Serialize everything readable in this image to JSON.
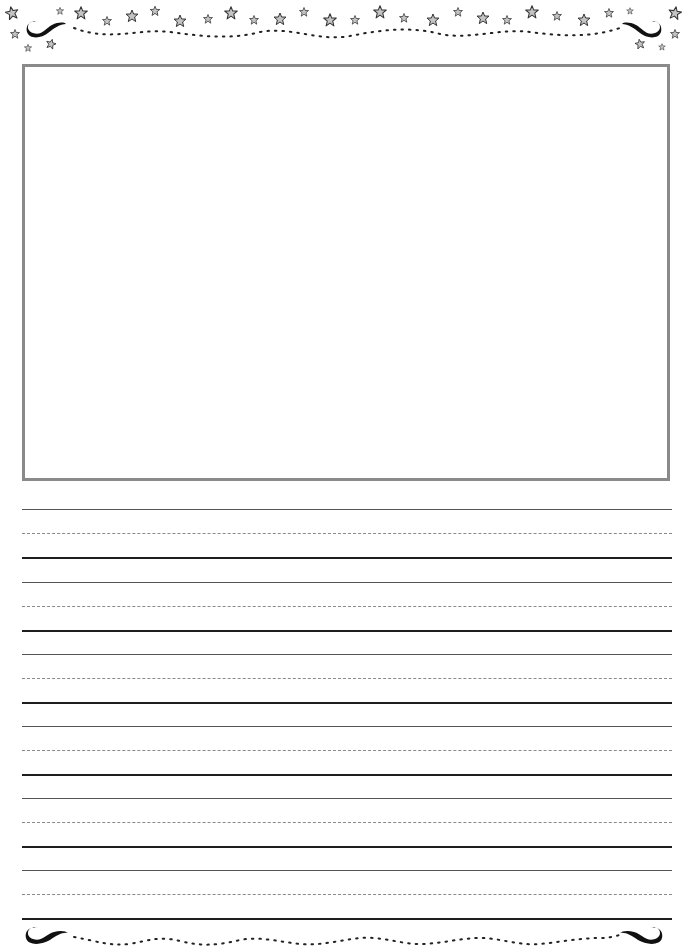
{
  "page": {
    "type": "primary-writing-paper",
    "background": "#ffffff"
  },
  "border": {
    "top": {
      "decoration": "stars-and-swirls",
      "icons": [
        "star-icon",
        "swirl-icon",
        "dotted-wave"
      ],
      "star_fill": "#c4c4c4",
      "star_stroke": "#333333",
      "swirl_color": "#111111"
    },
    "bottom": {
      "decoration": "swirls-and-dots",
      "icons": [
        "swirl-icon",
        "dotted-wave"
      ]
    }
  },
  "picture_box": {
    "border_color": "#8a8a8a",
    "content": ""
  },
  "writing_lines": {
    "set_count": 6,
    "sets": [
      {
        "top": 509,
        "mid": 533,
        "base": 557
      },
      {
        "top": 582,
        "mid": 606,
        "base": 630
      },
      {
        "top": 654,
        "mid": 678,
        "base": 702
      },
      {
        "top": 726,
        "mid": 750,
        "base": 774
      },
      {
        "top": 798,
        "mid": 822,
        "base": 846
      },
      {
        "top": 870,
        "mid": 894,
        "base": 918
      }
    ],
    "colors": {
      "top": "#555555",
      "mid": "#8a8a8a",
      "base": "#1e1e1e"
    }
  }
}
